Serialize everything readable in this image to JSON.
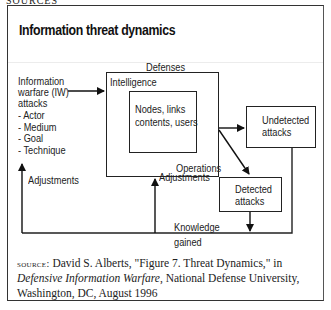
{
  "figure": {
    "cut_text": "SOURCES",
    "title": "Information threat dynamics",
    "nodes": {
      "defenses_heading": "Defenses",
      "intelligence": "Intelligence",
      "operations": "Operations",
      "core_line1": "Nodes, links",
      "core_line2": "contents, users",
      "undetected_line1": "Undetected",
      "undetected_line2": "attacks",
      "detected_line1": "Detected",
      "detected_line2": "attacks"
    },
    "attack_source": {
      "line1": "Information",
      "line2": "warfare (IW)",
      "line3": "attacks",
      "attributes": [
        "- Actor",
        "- Medium",
        "- Goal",
        "- Technique"
      ]
    },
    "edges": {
      "adjustments_left": "Adjustments",
      "adjustments_mid": "Adjustments",
      "knowledge_line1": "Knowledge",
      "knowledge_line2": "gained"
    },
    "source": {
      "label": "source:",
      "author": "David S. Alberts, \"Figure 7. Threat Dynamics,\" in ",
      "work": "Defensive Information Warfare",
      "publisher": ", National Defense University, Washington, DC, August 1996"
    }
  }
}
